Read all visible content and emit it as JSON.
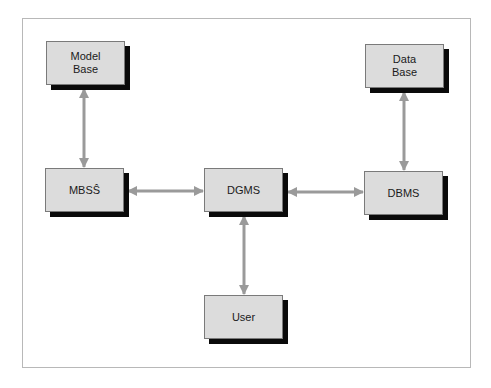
{
  "diagram": {
    "type": "block-diagram",
    "colors": {
      "frame_border": "#b8b8b8",
      "box_fill": "#dcdcdc",
      "box_border": "#7a7a7a",
      "box_shadow": "#0a0a0a",
      "arrow": "#9a9a9a",
      "text": "#1a1a1a"
    },
    "nodes": [
      {
        "id": "model-base",
        "label": "Model\nBase",
        "x": 46,
        "y": 41
      },
      {
        "id": "data-base",
        "label": "Data\nBase",
        "x": 365,
        "y": 44
      },
      {
        "id": "mbss",
        "label": "MBSŜ",
        "x": 45,
        "y": 168
      },
      {
        "id": "dgms",
        "label": "DGMS",
        "x": 204,
        "y": 168
      },
      {
        "id": "dbms",
        "label": "DBMS",
        "x": 364,
        "y": 171
      },
      {
        "id": "user",
        "label": "User",
        "x": 204,
        "y": 295
      }
    ],
    "edges": [
      {
        "from": "model-base",
        "to": "mbss",
        "direction": "bidirectional"
      },
      {
        "from": "data-base",
        "to": "dbms",
        "direction": "bidirectional"
      },
      {
        "from": "mbss",
        "to": "dgms",
        "direction": "bidirectional"
      },
      {
        "from": "dgms",
        "to": "dbms",
        "direction": "bidirectional"
      },
      {
        "from": "dgms",
        "to": "user",
        "direction": "bidirectional"
      }
    ]
  }
}
